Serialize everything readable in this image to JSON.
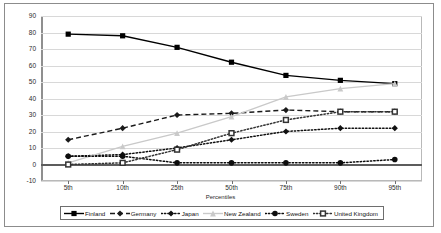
{
  "chart_data": {
    "type": "line",
    "title": "",
    "xlabel": "Percentiles",
    "ylabel": "",
    "categories": [
      "5th",
      "10th",
      "25th",
      "50th",
      "75th",
      "90th",
      "95th"
    ],
    "ylim": [
      -10,
      90
    ],
    "ytick_step": 10,
    "yticks": [
      "90",
      "80",
      "70",
      "60",
      "50",
      "40",
      "30",
      "20",
      "10",
      "0",
      "-10"
    ],
    "grid": true,
    "legend_position": "bottom",
    "series": [
      {
        "name": "Finland",
        "values": [
          79,
          78,
          71,
          62,
          54,
          51,
          49
        ],
        "color": "#000000",
        "marker": "square",
        "line_style": "solid"
      },
      {
        "name": "Germany",
        "values": [
          15,
          22,
          30,
          31,
          33,
          32,
          32
        ],
        "color": "#1a1a1a",
        "marker": "diamond",
        "line_style": "dashed"
      },
      {
        "name": "Japan",
        "values": [
          5,
          6,
          10,
          15,
          20,
          22,
          22
        ],
        "color": "#111111",
        "marker": "diamond",
        "line_style": "dotted"
      },
      {
        "name": "New Zealand",
        "values": [
          1,
          11,
          19,
          29,
          41,
          46,
          49
        ],
        "color": "#c9c9c9",
        "marker": "triangle",
        "line_style": "solid"
      },
      {
        "name": "Sweden",
        "values": [
          5,
          5,
          1,
          1,
          1,
          1,
          3
        ],
        "color": "#0d0d0d",
        "marker": "circle",
        "line_style": "dotted"
      },
      {
        "name": "United Kingdom",
        "values": [
          0,
          1,
          9,
          19,
          27,
          32,
          32
        ],
        "color": "#333333",
        "marker": "square-open",
        "line_style": "dotted"
      }
    ]
  },
  "legend": {
    "items": [
      {
        "label": "Finland"
      },
      {
        "label": "Germany"
      },
      {
        "label": "Japan"
      },
      {
        "label": "New Zealand"
      },
      {
        "label": "Sweden"
      },
      {
        "label": "United Kingdom"
      }
    ]
  }
}
